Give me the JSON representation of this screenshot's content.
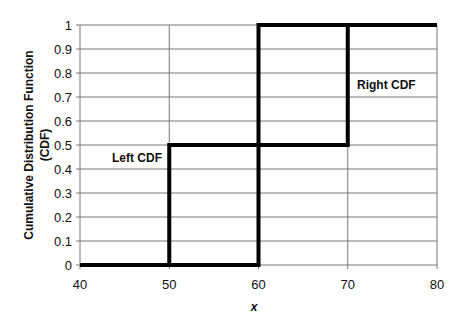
{
  "chart_data": {
    "type": "line",
    "title": "",
    "xlabel": "x",
    "ylabel": "Cumulative Distribution Function (CDF)",
    "ylabel_lines": [
      "Cumulative Distribution Function",
      "(CDF)"
    ],
    "xlim": [
      40,
      80
    ],
    "ylim": [
      0,
      1
    ],
    "x_ticks": [
      40,
      50,
      60,
      70,
      80
    ],
    "y_ticks": [
      0,
      0.1,
      0.2,
      0.3,
      0.4,
      0.5,
      0.6,
      0.7,
      0.8,
      0.9,
      1
    ],
    "grid": true,
    "series": [
      {
        "name": "Left CDF",
        "step": true,
        "x": [
          40,
          50,
          50,
          60,
          60,
          80
        ],
        "y": [
          0,
          0,
          0.5,
          0.5,
          1,
          1
        ]
      },
      {
        "name": "Right CDF",
        "step": true,
        "x": [
          40,
          60,
          60,
          70,
          70,
          80
        ],
        "y": [
          0,
          0,
          0.5,
          0.5,
          1,
          1
        ]
      }
    ],
    "annotations": [
      {
        "text": "Left CDF",
        "x": 45,
        "y": 0.45
      },
      {
        "text": "Right CDF",
        "x": 75,
        "y": 0.75
      }
    ]
  }
}
